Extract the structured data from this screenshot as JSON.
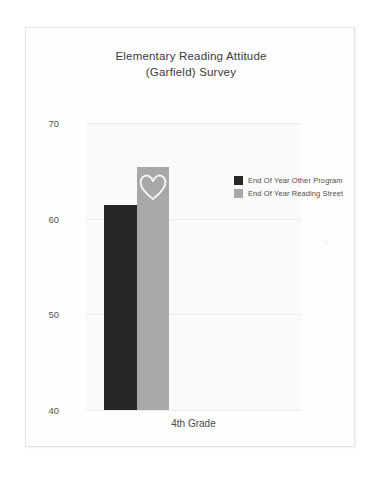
{
  "page": {
    "background_color": "#ffffff",
    "sheet_color": "#fefefe",
    "sheet_border_color": "#e3e3e3"
  },
  "chart_data": {
    "type": "bar",
    "title": "Elementary Reading Attitude\n(Garfield) Survey",
    "title_line1": "Elementary Reading Attitude",
    "title_line2": "(Garfield) Survey",
    "xlabel": "",
    "ylabel": "",
    "categories": [
      "4th Grade"
    ],
    "series": [
      {
        "name": "End Of Year Other Program",
        "values": [
          61.4
        ],
        "color": "#262626"
      },
      {
        "name": "End Of Year Reading Street",
        "values": [
          65.4
        ],
        "color": "#a8a8a8"
      }
    ],
    "ylim": [
      40,
      70
    ],
    "yticks": [
      40,
      50,
      60,
      70
    ],
    "ytick_labels": [
      "40",
      "50",
      "60",
      "70"
    ],
    "xtick_labels": [
      "4th Grade"
    ],
    "grid": true,
    "grid_axis": "y",
    "legend_position": "center right",
    "plot_background": "#fafafa",
    "annotations": [
      {
        "kind": "hand-drawn-heart",
        "shape": "heart-outline",
        "color": "#f2f2f2",
        "on_series": "End Of Year Reading Street"
      }
    ]
  },
  "legend": {
    "items": [
      {
        "label": "End Of Year Other Program",
        "color": "#262626"
      },
      {
        "label": "End Of Year Reading Street",
        "color": "#a8a8a8"
      }
    ]
  }
}
